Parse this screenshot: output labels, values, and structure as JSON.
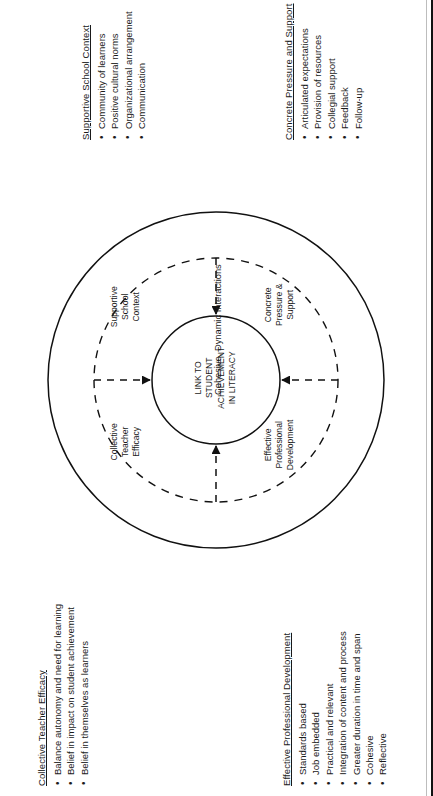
{
  "page": {
    "orientation": "rotated-90-ccw"
  },
  "diagram": {
    "center_label": "LINK TO\nSTUDENT\nACHIEVEMENT\nIN LITERACY",
    "outer_ring_label": "Cohesive, Dynamic Interactions",
    "quadrants": [
      {
        "id": "supportive-school-context",
        "label": "Supportive\nSchool\nContext"
      },
      {
        "id": "concrete-pressure-support",
        "label": "Concrete\nPressure &\nSupport"
      },
      {
        "id": "collective-teacher-efficacy",
        "label": "Collective\nTeacher\nEfficacy"
      },
      {
        "id": "effective-professional-development",
        "label": "Effective\nProfessional\nDevelopment"
      }
    ]
  },
  "lists": {
    "supportive_school_context": {
      "title": "Supportive School Context",
      "items": [
        "Community of learners",
        "Positive cultural norms",
        "Organizational arrangement",
        "Communication"
      ]
    },
    "concrete_pressure_and_support": {
      "title": "Concrete Pressure and Support",
      "items": [
        "Articulated expectations",
        "Provision of resources",
        "Collegial support",
        "Feedback",
        "Follow-up"
      ]
    },
    "collective_teacher_efficacy": {
      "title": "Collective Teacher Efficacy",
      "items": [
        "Balance autonomy and need for learning",
        "Belief in impact on student achievement",
        "Belief in themselves as learners"
      ]
    },
    "effective_professional_development": {
      "title": "Effective Professional Development",
      "items": [
        "Standards based",
        "Job embedded",
        "Practical and relevant",
        "Integration of content and process",
        "Greater duration in time and span",
        "Cohesive",
        "Reflective"
      ]
    }
  },
  "colors": {
    "ink": "#1a1a1a",
    "stroke": "#111111",
    "background": "#ffffff"
  }
}
